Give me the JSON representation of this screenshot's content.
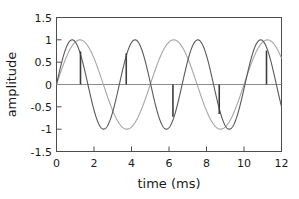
{
  "chart_data": {
    "type": "line",
    "title": "",
    "xlabel": "time (ms)",
    "ylabel": "amplitude",
    "xlim": [
      0,
      12
    ],
    "ylim": [
      -1.5,
      1.5
    ],
    "xticks": [
      0,
      2,
      4,
      6,
      8,
      10,
      12
    ],
    "xtick_labels": [
      "0",
      "2",
      "4",
      "6",
      "8",
      "10",
      "12"
    ],
    "yticks": [
      -1.5,
      -1,
      -0.5,
      0,
      0.5,
      1,
      1.5
    ],
    "ytick_labels": [
      "-1.5",
      "-1",
      "-0.5",
      "0",
      "0.5",
      "1",
      "1.5"
    ],
    "grid": false,
    "legend": "none",
    "series": [
      {
        "name": "fast sine",
        "kind": "sine",
        "color": "#595959",
        "amplitude": 1.0,
        "frequency_khz": 0.2985,
        "phase_deg": 0,
        "period_ms": 3.35,
        "cycles_shown": 3.58,
        "peaks_ms": [
          0.84,
          4.19,
          7.54,
          10.89
        ],
        "troughs_ms": [
          2.51,
          5.86,
          9.21,
          12.0
        ]
      },
      {
        "name": "slow sine",
        "kind": "sine",
        "color": "#a6a6a6",
        "amplitude": 1.0,
        "frequency_khz": 0.2,
        "phase_deg": 0,
        "period_ms": 5.0,
        "cycles_shown": 2.4,
        "peaks_ms": [
          1.25,
          6.25,
          11.25
        ],
        "troughs_ms": [
          3.75,
          8.75
        ]
      }
    ],
    "markers": {
      "name": "beat spikes",
      "color": "#3d3d3d",
      "baseline": 0,
      "points": [
        {
          "t_ms": 1.28,
          "value": 0.74
        },
        {
          "t_ms": 3.72,
          "value": 0.7
        },
        {
          "t_ms": 6.21,
          "value": -0.72
        },
        {
          "t_ms": 8.68,
          "value": -0.66
        },
        {
          "t_ms": 11.2,
          "value": 0.76
        }
      ]
    },
    "zero_line": {
      "y": 0,
      "color": "#8c8c8c"
    }
  },
  "axes": {
    "x_title": "time (ms)",
    "y_title": "amplitude"
  }
}
